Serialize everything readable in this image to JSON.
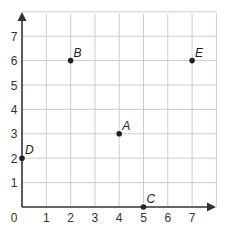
{
  "chart_data": {
    "type": "scatter",
    "title": "",
    "xlabel": "",
    "ylabel": "",
    "xlim": [
      0,
      8
    ],
    "ylim": [
      0,
      8
    ],
    "grid": true,
    "x_ticks": [
      "0",
      "1",
      "2",
      "3",
      "4",
      "5",
      "6",
      "7"
    ],
    "y_ticks": [
      "1",
      "2",
      "3",
      "4",
      "5",
      "6",
      "7"
    ],
    "points": [
      {
        "label": "A",
        "x": 4,
        "y": 3
      },
      {
        "label": "B",
        "x": 2,
        "y": 6
      },
      {
        "label": "C",
        "x": 5,
        "y": 0
      },
      {
        "label": "D",
        "x": 0,
        "y": 2
      },
      {
        "label": "E",
        "x": 7,
        "y": 6
      }
    ]
  },
  "colors": {
    "grid": "#cccccc",
    "axis": "#333333",
    "point": "#222222"
  }
}
